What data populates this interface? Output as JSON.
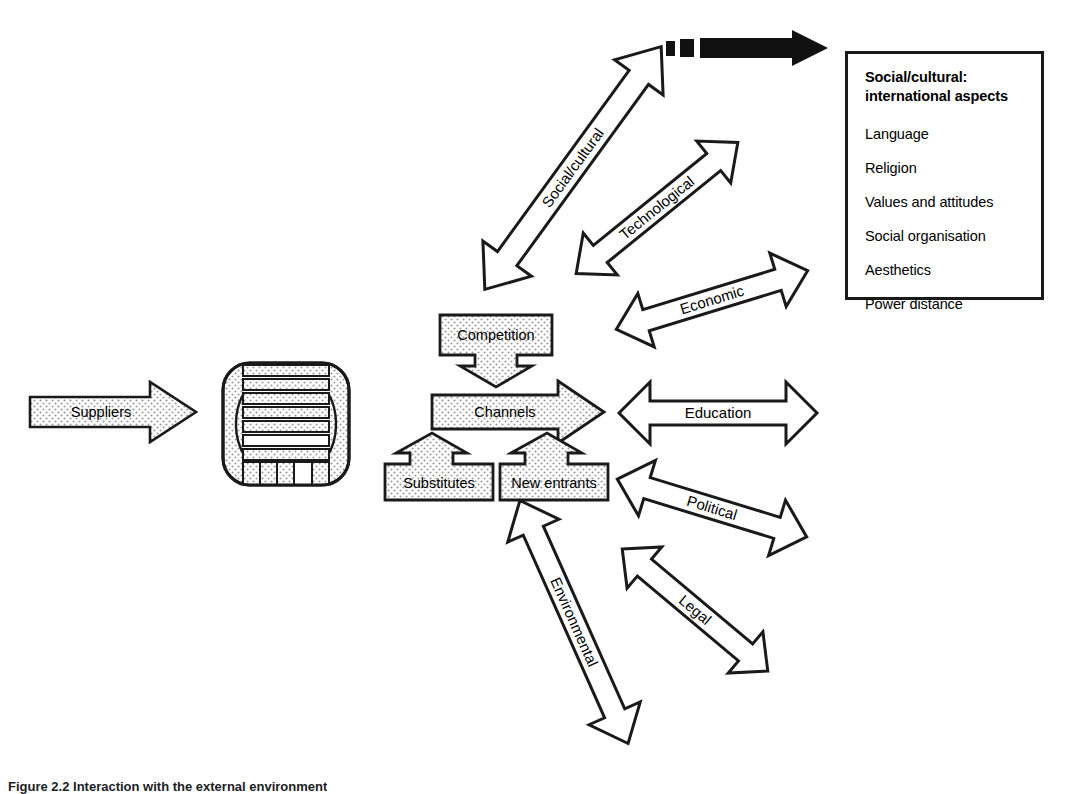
{
  "figure": {
    "caption": "Figure 2.2 Interaction with the external environment",
    "colors": {
      "stroke": "#1a1a1a",
      "fill": "#ffffff",
      "stipple": "#d8d8d8",
      "solid_arrow": "#111111"
    }
  },
  "flow": {
    "suppliers": {
      "label": "Suppliers",
      "shape": "right-arrow",
      "filled": "stippled"
    },
    "organisation": {
      "label": "",
      "shape": "organisation-symbol",
      "bands": 7,
      "segments": 5
    }
  },
  "forces": {
    "competition": {
      "label": "Competition",
      "shape": "box-down-arrow"
    },
    "channels": {
      "label": "Channels",
      "shape": "right-arrow"
    },
    "substitutes": {
      "label": "Substitutes",
      "shape": "box-up-arrow"
    },
    "new_entrants": {
      "label": "New entrants",
      "shape": "box-up-arrow"
    }
  },
  "environment_arrows": [
    {
      "id": "social-cultural",
      "label": "Social/cultural",
      "angle_deg": -54,
      "style": "double-headed"
    },
    {
      "id": "technological",
      "label": "Technological",
      "angle_deg": -39,
      "style": "double-headed"
    },
    {
      "id": "economic",
      "label": "Economic",
      "angle_deg": -17,
      "style": "double-headed"
    },
    {
      "id": "education",
      "label": "Education",
      "angle_deg": 0,
      "style": "double-headed"
    },
    {
      "id": "political",
      "label": "Political",
      "angle_deg": 17,
      "style": "double-headed"
    },
    {
      "id": "legal",
      "label": "Legal",
      "angle_deg": 40,
      "style": "double-headed"
    },
    {
      "id": "environmental",
      "label": "Environmental",
      "angle_deg": 66,
      "style": "double-headed"
    }
  ],
  "pointer": {
    "id": "legend-pointer",
    "style": "dashed-to-solid-right-arrow",
    "color": "#111111"
  },
  "legend": {
    "title_line1": "Social/cultural:",
    "title_line2": "international aspects",
    "items": [
      "Language",
      "Religion",
      "Values and attitudes",
      "Social organisation",
      "Aesthetics",
      "Power distance"
    ]
  }
}
